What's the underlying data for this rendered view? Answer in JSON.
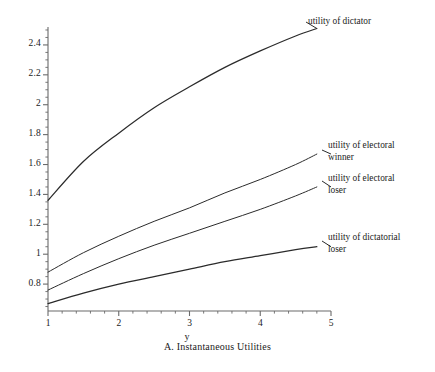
{
  "figure": {
    "caption": "A. Instantaneous Utilities",
    "xname": "y"
  },
  "chart_data": {
    "type": "line",
    "title": "A. Instantaneous Utilities",
    "xlabel": "y",
    "ylabel": "",
    "xlim": [
      1,
      5
    ],
    "ylim": [
      0.62,
      2.52
    ],
    "grid": false,
    "legend_position": "inline-right-annotations",
    "xticks": [
      1,
      2,
      3,
      4,
      5
    ],
    "xticklabels": [
      "1",
      "2",
      "3",
      "4",
      "5"
    ],
    "yticks": [
      0.8,
      1,
      1.2,
      1.4,
      1.6,
      1.8,
      2,
      2.2,
      2.4
    ],
    "yticklabels": [
      "0.8",
      "1",
      "1.2",
      "1.4",
      "1.6",
      "1.8",
      "2",
      "2.2",
      "2.4"
    ],
    "x": [
      1,
      1.5,
      2,
      2.5,
      3,
      3.5,
      4,
      4.5,
      4.8
    ],
    "series": [
      {
        "name": "utility of dictator",
        "label": "utility of dictator",
        "values": [
          1.36,
          1.62,
          1.81,
          1.98,
          2.12,
          2.25,
          2.36,
          2.46,
          2.51
        ]
      },
      {
        "name": "utility of electoral winner",
        "label": "utility of electoral\nwinner",
        "label_line1": "utility of electoral",
        "label_line2": "winner",
        "values": [
          0.88,
          1.01,
          1.12,
          1.22,
          1.31,
          1.41,
          1.5,
          1.6,
          1.67
        ]
      },
      {
        "name": "utility of electoral loser",
        "label": "utility of electoral\nloser",
        "label_line1": "utility of electoral",
        "label_line2": "loser",
        "values": [
          0.76,
          0.87,
          0.97,
          1.06,
          1.14,
          1.22,
          1.3,
          1.39,
          1.45
        ]
      },
      {
        "name": "utility of dictatorial loser",
        "label": "utility of dictatorial\nloser",
        "label_line1": "utility of dictatorial",
        "label_line2": "loser",
        "values": [
          0.67,
          0.74,
          0.8,
          0.85,
          0.9,
          0.95,
          0.99,
          1.03,
          1.05
        ]
      }
    ],
    "annotations": [
      {
        "text": "utility of dictator",
        "x": 4.9,
        "y": 2.53
      },
      {
        "text": "utility of electoral winner",
        "x": 4.95,
        "y": 1.72
      },
      {
        "text": "utility of electoral loser",
        "x": 4.95,
        "y": 1.5
      },
      {
        "text": "utility of dictatorial loser",
        "x": 4.95,
        "y": 1.11
      }
    ],
    "colors": {
      "line": "#2b2b2b",
      "axis": "#555555",
      "text": "#1b1b1b"
    }
  }
}
